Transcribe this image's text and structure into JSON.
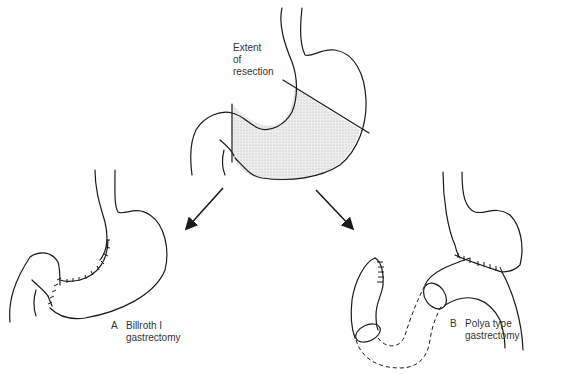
{
  "diagram": {
    "top": {
      "label_lines": [
        "Extent",
        "of",
        "resection"
      ],
      "shaded_color": "#e4e4e4"
    },
    "left": {
      "letter": "A",
      "title_lines": [
        "Billroth I",
        "gastrectomy"
      ]
    },
    "right": {
      "letter": "B",
      "title_lines": [
        "Polya type",
        "gastrectomy"
      ]
    }
  }
}
